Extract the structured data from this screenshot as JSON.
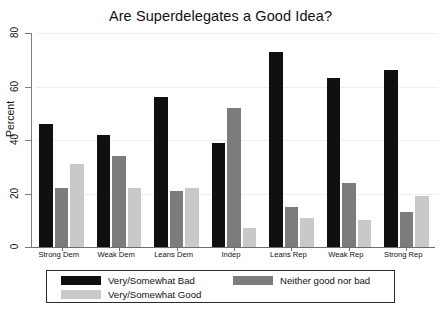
{
  "chart_data": {
    "type": "bar",
    "title": "Are Superdelegates a Good Idea?",
    "xlabel": "",
    "ylabel": "Percent",
    "ylim": [
      0,
      80
    ],
    "yticks": [
      0,
      20,
      40,
      60,
      80
    ],
    "grid": true,
    "legend_position": "bottom",
    "categories": [
      "Strong Dem",
      "Weak Dem",
      "Leans Dem",
      "Indep",
      "Leans Rep",
      "Weak Rep",
      "Strong Rep"
    ],
    "series": [
      {
        "name": "Very/Somewhat Bad",
        "color": "#101010",
        "values": [
          46,
          42,
          56,
          39,
          73,
          63,
          66
        ]
      },
      {
        "name": "Neither good nor bad",
        "color": "#7c7c7c",
        "values": [
          22,
          34,
          21,
          52,
          15,
          24,
          13
        ]
      },
      {
        "name": "Very/Somewhat Good",
        "color": "#c9c9c9",
        "values": [
          31,
          22,
          22,
          7,
          11,
          10,
          19
        ]
      }
    ]
  },
  "legend": {
    "entries": [
      "Very/Somewhat Bad",
      "Very/Somewhat Good",
      "Neither good nor bad"
    ]
  }
}
